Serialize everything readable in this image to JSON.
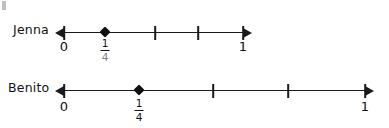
{
  "figure": {
    "ink_color": "#1a1a1a",
    "background": "#ffffff"
  },
  "rows": [
    {
      "name": "jenna",
      "label": "Jenna",
      "line": {
        "left_px": 64,
        "right_px": 243,
        "y_px": 33,
        "left_arrow": true,
        "right_arrow": true
      },
      "ticks": [
        {
          "x_px": 64,
          "value": "0"
        },
        {
          "x_px": 155,
          "value": ""
        },
        {
          "x_px": 198,
          "value": ""
        },
        {
          "x_px": 243,
          "value": "1"
        }
      ],
      "point": {
        "x_px": 105,
        "label_num": "1",
        "label_den": "4"
      },
      "labels": [
        {
          "x_px": 64,
          "text": "0"
        },
        {
          "x_px": 243,
          "text": "1"
        }
      ]
    },
    {
      "name": "benito",
      "label": "Benito",
      "line": {
        "left_px": 64,
        "right_px": 365,
        "y_px": 91,
        "left_arrow": true,
        "right_arrow": true
      },
      "ticks": [
        {
          "x_px": 64,
          "value": "0"
        },
        {
          "x_px": 213,
          "value": ""
        },
        {
          "x_px": 288,
          "value": ""
        },
        {
          "x_px": 365,
          "value": "1"
        }
      ],
      "point": {
        "x_px": 139,
        "label_num": "1",
        "label_den": "4"
      },
      "labels": [
        {
          "x_px": 64,
          "text": "0"
        },
        {
          "x_px": 365,
          "text": "1"
        }
      ]
    }
  ]
}
